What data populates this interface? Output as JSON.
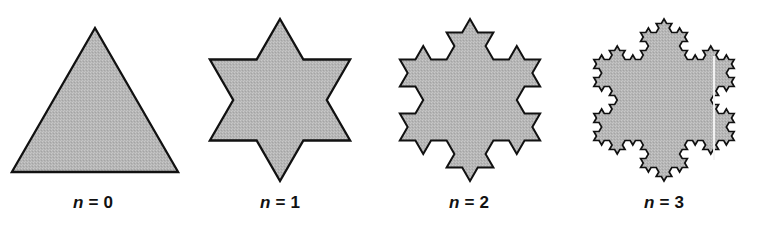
{
  "figure": {
    "width": 764,
    "height": 227,
    "background_color": "#ffffff",
    "fill_color": "#b5b5b5",
    "stroke_color": "#111111",
    "label_color": "#111111"
  },
  "chart_data": {
    "type": "diagram",
    "subtype": "koch-snowflake-iterations",
    "title": "",
    "xlabel": "",
    "ylabel": "",
    "grid": false,
    "legend": "none",
    "categories": [
      "n = 0",
      "n = 1",
      "n = 2",
      "n = 3"
    ],
    "values": [
      0,
      1,
      2,
      3
    ],
    "series": [
      {
        "name": "iteration depth",
        "values": [
          0,
          1,
          2,
          3
        ]
      },
      {
        "name": "edge count",
        "values": [
          3,
          12,
          48,
          192
        ]
      }
    ],
    "annotations": [
      "n = 0",
      "n = 1",
      "n = 2",
      "n = 3"
    ]
  },
  "panels": [
    {
      "id": "panel-n0",
      "label_var": "n",
      "label_eq": "= 0",
      "iteration": 0,
      "shape_name": "equilateral-triangle",
      "left": 0,
      "width": 186,
      "center_x": 95,
      "center_y": 100,
      "size": 150,
      "stroke_width": 2.3
    },
    {
      "id": "panel-n1",
      "label_var": "n",
      "label_eq": "= 1",
      "iteration": 1,
      "shape_name": "six-point-star",
      "left": 186,
      "width": 188,
      "center_x": 94,
      "center_y": 100,
      "size": 150,
      "stroke_width": 2.3
    },
    {
      "id": "panel-n2",
      "label_var": "n",
      "label_eq": "= 2",
      "iteration": 2,
      "shape_name": "koch-snowflake-level-2",
      "left": 374,
      "width": 190,
      "center_x": 96,
      "center_y": 100,
      "size": 150,
      "stroke_width": 2.0
    },
    {
      "id": "panel-n3",
      "label_var": "n",
      "label_eq": "= 3",
      "iteration": 3,
      "shape_name": "koch-snowflake-level-3",
      "left": 564,
      "width": 200,
      "center_x": 100,
      "center_y": 100,
      "size": 150,
      "stroke_width": 1.7
    }
  ],
  "artifacts": {
    "scanline": {
      "name": "scan-line-artifact",
      "x": 713,
      "y": 56,
      "width": 2,
      "height": 104,
      "color": "#f4f4f4"
    }
  }
}
